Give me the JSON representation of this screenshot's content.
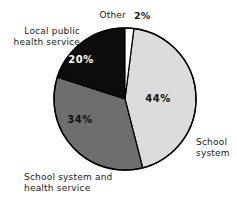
{
  "chart_data": {
    "type": "pie",
    "title": "",
    "subtitle": "",
    "xlabel": "",
    "ylabel": "",
    "legend_position": "outside-labels",
    "grid": false,
    "units": "percent",
    "categories": [
      "School system",
      "School system and health service",
      "Local public health service",
      "Other"
    ],
    "values": [
      44,
      34,
      20,
      2
    ],
    "value_labels": [
      "44%",
      "34%",
      "20%",
      "2%"
    ],
    "colors": [
      "#dcdcdc",
      "#6e6e6e",
      "#0d0d0d",
      "#ffffff"
    ],
    "start_angle_deg": 7,
    "direction": "clockwise",
    "slices": [
      {
        "label": "School system",
        "label_line1": "School",
        "label_line2": "system",
        "value": 44,
        "value_label": "44%",
        "color": "#dcdcdc",
        "text_color": "#111111"
      },
      {
        "label": "School system and health service",
        "label_line1": "School system and",
        "label_line2": "health service",
        "value": 34,
        "value_label": "34%",
        "color": "#6e6e6e",
        "text_color": "#111111"
      },
      {
        "label": "Local public health service",
        "label_line1": "Local public",
        "label_line2": "health service",
        "value": 20,
        "value_label": "20%",
        "color": "#0d0d0d",
        "text_color": "#ffffff"
      },
      {
        "label": "Other",
        "label_line1": "Other",
        "label_line2": "",
        "value": 2,
        "value_label": "2%",
        "color": "#ffffff",
        "text_color": "#111111"
      }
    ]
  },
  "figure": {
    "background": "#ffffff",
    "outline_color": "#000000",
    "center_x": 125,
    "center_y": 99,
    "radius": 71
  },
  "labels": {
    "other": "Other",
    "other_pct": "2%",
    "local_public_line1": "Local public",
    "local_public_line2": "health service",
    "school_health_line1": "School system and",
    "school_health_line2": "health service",
    "school_system_line1": "School",
    "school_system_line2": "system",
    "pct_44": "44%",
    "pct_34": "34%",
    "pct_20": "20%"
  }
}
